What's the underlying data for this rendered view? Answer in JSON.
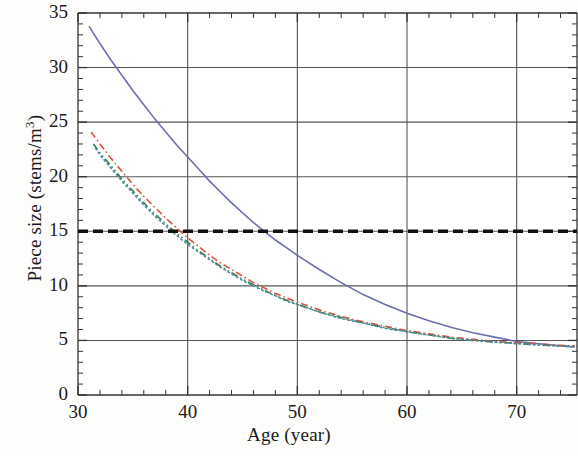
{
  "chart_data": {
    "type": "line",
    "title": "",
    "xlabel": "Age (year)",
    "ylabel": "Piece size (stems/m3)",
    "ylabel_base": "Piece size (stems/m",
    "ylabel_sup": "3",
    "ylabel_tail": ")",
    "xlim": [
      30,
      75.5
    ],
    "ylim": [
      0,
      35
    ],
    "xticks": [
      30,
      40,
      50,
      60,
      70
    ],
    "yticks": [
      0,
      5,
      10,
      15,
      20,
      25,
      30,
      35
    ],
    "xtick_labels": [
      "30",
      "40",
      "50",
      "60",
      "70"
    ],
    "ytick_labels": [
      "0",
      "5",
      "10",
      "15",
      "20",
      "25",
      "30",
      "35"
    ],
    "x_minor_interval": 2,
    "y_minor_interval": 1,
    "grid": true,
    "grid_color": "#555555",
    "legend": "none",
    "series": [
      {
        "name": "solid-blue-curve",
        "color": "#6b6fae",
        "style": "solid",
        "x": [
          31.0,
          32.0,
          33.0,
          34.0,
          35.0,
          36.0,
          37.0,
          38.0,
          39.0,
          40.0,
          41.0,
          42.0,
          43.0,
          44.0,
          45.0,
          46.0,
          47.0,
          48.0,
          49.0,
          50.0,
          52.0,
          54.0,
          56.0,
          58.0,
          60.0,
          62.0,
          64.0,
          66.0,
          68.0,
          70.0,
          71.0,
          72.0,
          73.0,
          74.0,
          75.3
        ],
        "y": [
          33.8,
          32.2,
          30.7,
          29.3,
          27.9,
          26.6,
          25.3,
          24.1,
          22.9,
          21.8,
          20.7,
          19.6,
          18.6,
          17.6,
          16.7,
          15.8,
          15.0,
          14.2,
          13.5,
          12.8,
          11.5,
          10.3,
          9.2,
          8.3,
          7.5,
          6.8,
          6.2,
          5.7,
          5.3,
          4.9,
          4.8,
          4.7,
          4.6,
          4.5,
          4.4
        ]
      },
      {
        "name": "red-dash-dot-curve",
        "color": "#d0543f",
        "style": "dash-dot",
        "x": [
          31.2,
          32.0,
          33.0,
          34.0,
          35.0,
          36.0,
          37.0,
          38.0,
          39.0,
          40.0,
          41.0,
          42.0,
          43.0,
          44.0,
          45.0,
          46.0,
          47.0,
          48.0,
          49.0,
          50.0,
          52.0,
          54.0,
          56.0,
          58.0,
          60.0,
          62.0,
          64.0,
          66.0,
          68.0,
          70.0,
          71.0,
          72.0,
          73.0,
          74.0,
          75.3
        ],
        "y": [
          24.1,
          23.0,
          21.7,
          20.5,
          19.3,
          18.2,
          17.2,
          16.2,
          15.3,
          14.4,
          13.6,
          12.8,
          12.1,
          11.5,
          10.9,
          10.3,
          9.8,
          9.3,
          8.9,
          8.5,
          7.8,
          7.2,
          6.7,
          6.3,
          5.9,
          5.6,
          5.3,
          5.1,
          4.9,
          4.8,
          4.75,
          4.7,
          4.6,
          4.55,
          4.5
        ]
      },
      {
        "name": "green-dash-dot-dot-curve",
        "color": "#3f7a4e",
        "style": "dash-dot-dot",
        "x": [
          31.4,
          32.0,
          33.0,
          34.0,
          35.0,
          36.0,
          37.0,
          38.0,
          39.0,
          40.0,
          41.0,
          42.0,
          43.0,
          44.0,
          45.0,
          46.0,
          47.0,
          48.0,
          49.0,
          50.0,
          52.0,
          54.0,
          56.0,
          58.0,
          60.0,
          62.0,
          64.0,
          66.0,
          68.0,
          70.0,
          71.0,
          72.0,
          73.0,
          74.0,
          75.3
        ],
        "y": [
          23.0,
          22.2,
          21.0,
          19.8,
          18.7,
          17.6,
          16.6,
          15.7,
          14.8,
          14.0,
          13.2,
          12.5,
          11.8,
          11.2,
          10.6,
          10.1,
          9.6,
          9.1,
          8.7,
          8.3,
          7.6,
          7.1,
          6.6,
          6.2,
          5.8,
          5.5,
          5.2,
          5.0,
          4.85,
          4.72,
          4.66,
          4.6,
          4.55,
          4.5,
          4.45
        ]
      },
      {
        "name": "teal-dotted-curve",
        "color": "#4b8ba0",
        "style": "dotted",
        "x": [
          31.6,
          32.0,
          33.0,
          34.0,
          35.0,
          36.0,
          37.0,
          38.0,
          39.0,
          40.0,
          41.0,
          42.0,
          43.0,
          44.0,
          45.0,
          46.0,
          47.0,
          48.0,
          49.0,
          50.0,
          52.0,
          54.0,
          56.0,
          58.0,
          60.0,
          62.0,
          64.0,
          66.0,
          68.0,
          70.0,
          71.0,
          72.0,
          73.0,
          74.0,
          75.3
        ],
        "y": [
          22.6,
          22.0,
          20.8,
          19.6,
          18.5,
          17.4,
          16.4,
          15.5,
          14.6,
          13.8,
          13.1,
          12.4,
          11.7,
          11.1,
          10.5,
          10.0,
          9.5,
          9.1,
          8.6,
          8.3,
          7.6,
          7.0,
          6.6,
          6.1,
          5.8,
          5.5,
          5.2,
          5.0,
          4.85,
          4.7,
          4.64,
          4.58,
          4.52,
          4.48,
          4.42
        ]
      },
      {
        "name": "black-dashed-threshold-line",
        "color": "#111111",
        "style": "heavy-dashed",
        "x": [
          30,
          75.5
        ],
        "y": [
          15,
          15
        ]
      }
    ],
    "threshold_value": 15
  }
}
